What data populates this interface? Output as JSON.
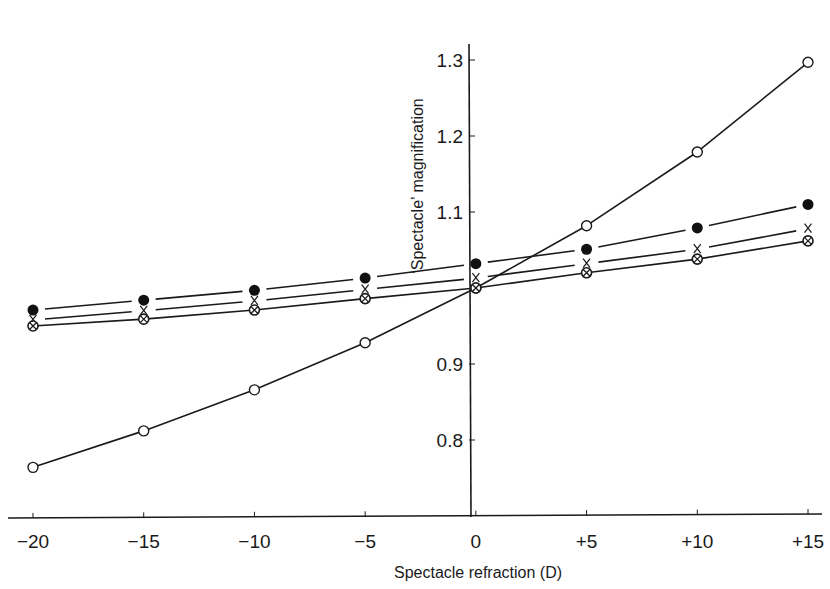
{
  "chart_data": {
    "type": "line",
    "title": "",
    "xlabel": "Spectacle refraction (D)",
    "ylabel": "‘Spectacle’ magnification",
    "x": [
      -20,
      -15,
      -10,
      -5,
      0,
      5,
      10,
      15
    ],
    "x_tick_labels": [
      "−20",
      "−15",
      "−10",
      "−5",
      "0",
      "+5",
      "+10",
      "+15"
    ],
    "y_ticks": [
      0.8,
      0.9,
      1.1,
      1.2,
      1.3
    ],
    "y_tick_labels": [
      "0.8",
      "0.9",
      "1.1",
      "1.2",
      "1.3"
    ],
    "xlim": [
      -20,
      15
    ],
    "ylim": [
      0.7,
      1.33
    ],
    "grid": false,
    "legend": null,
    "series": [
      {
        "name": "open-circle",
        "marker": "open-circle",
        "line": "solid",
        "values": [
          0.764,
          0.812,
          0.866,
          0.928,
          1.0,
          1.082,
          1.179,
          1.297
        ]
      },
      {
        "name": "filled-circle",
        "marker": "filled-circle",
        "line": "broken",
        "values": [
          0.971,
          0.984,
          0.997,
          1.013,
          1.032,
          1.051,
          1.079,
          1.11
        ]
      },
      {
        "name": "cross",
        "marker": "x",
        "line": "broken",
        "values": [
          0.958,
          0.97,
          0.983,
          0.998,
          1.013,
          1.032,
          1.051,
          1.078
        ]
      },
      {
        "name": "crossed-circle",
        "marker": "crossed-circle",
        "line": "solid",
        "values": [
          0.95,
          0.959,
          0.971,
          0.986,
          1.0,
          1.02,
          1.038,
          1.062
        ]
      }
    ]
  }
}
